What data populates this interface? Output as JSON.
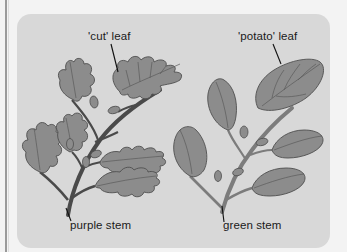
{
  "diagram": {
    "left_plant": {
      "leaf_label": "'cut' leaf",
      "stem_label": "purple stem"
    },
    "right_plant": {
      "leaf_label": "'potato' leaf",
      "stem_label": "green stem"
    },
    "colors": {
      "page_background": "#f3f3f3",
      "panel_background": "#d8d8d8",
      "leaf_fill": "#8c8c8c",
      "leaf_outline": "#4f4f4f",
      "left_stem": "#4a4a4a",
      "right_stem": "#7c7c7c",
      "label_text": "#1a1a1a"
    }
  }
}
